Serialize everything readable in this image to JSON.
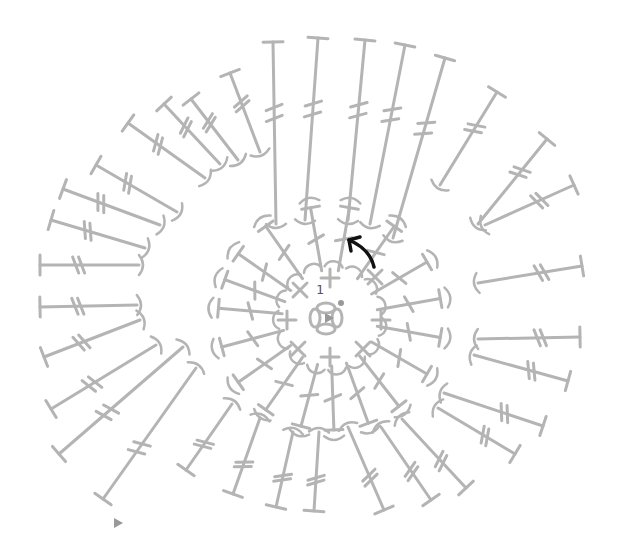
{
  "diagram": {
    "type": "crochet-chart",
    "title": "",
    "center": [
      330,
      318
    ],
    "colors": {
      "stitch": "#b4b4b4",
      "arrow": "#111111",
      "label": "#555555",
      "background": "#ffffff"
    },
    "round_label": "1",
    "round_label_pos": [
      316,
      294
    ],
    "magic_ring": {
      "cx": 326,
      "cy": 318,
      "r": 16,
      "start_dot": [
        341,
        303
      ]
    },
    "start_marker": {
      "icon": "triangle-marker",
      "pos": [
        329,
        318
      ]
    },
    "end_marker": {
      "icon": "triangle-marker",
      "pos": [
        118,
        523
      ]
    },
    "direction_arrow": {
      "icon": "curved-arrow",
      "from": [
        374,
        267
      ],
      "to": [
        349,
        240
      ]
    },
    "round1": {
      "stitch_type": "single-crochet",
      "stitches": [
        {
          "symbol": "+",
          "pos": [
            330,
            278
          ]
        },
        {
          "symbol": "x",
          "pos": [
            375,
            277
          ]
        },
        {
          "symbol": "+",
          "pos": [
            381,
            320
          ]
        },
        {
          "symbol": "x",
          "pos": [
            363,
            349
          ]
        },
        {
          "symbol": "+",
          "pos": [
            330,
            357
          ]
        },
        {
          "symbol": "x",
          "pos": [
            298,
            349
          ]
        },
        {
          "symbol": "+",
          "pos": [
            287,
            320
          ]
        },
        {
          "symbol": "x",
          "pos": [
            300,
            290
          ]
        }
      ]
    },
    "round2": {
      "stitch_type": "double-crochet",
      "inner_radius": 48,
      "outer_radius": 112,
      "angles_deg": [
        -100,
        -80,
        -55,
        -30,
        -10,
        10,
        30,
        52,
        70,
        88,
        105,
        125,
        145,
        165,
        185,
        200,
        215,
        235
      ]
    },
    "round3": {
      "stitch_type": "treble-crochet",
      "spokes": [
        {
          "from": [
            276,
            224
          ],
          "to": [
            273,
            42
          ]
        },
        {
          "from": [
            305,
            220
          ],
          "to": [
            318,
            38
          ]
        },
        {
          "from": [
            348,
            220
          ],
          "to": [
            365,
            40
          ]
        },
        {
          "from": [
            370,
            224
          ],
          "to": [
            405,
            45
          ]
        },
        {
          "from": [
            393,
            238
          ],
          "to": [
            445,
            58
          ]
        },
        {
          "from": [
            440,
            185
          ],
          "to": [
            497,
            92
          ]
        },
        {
          "from": [
            478,
            224
          ],
          "to": [
            547,
            139
          ]
        },
        {
          "from": [
            485,
            225
          ],
          "to": [
            574,
            185
          ]
        },
        {
          "from": [
            478,
            283
          ],
          "to": [
            582,
            266
          ]
        },
        {
          "from": [
            478,
            339
          ],
          "to": [
            580,
            337
          ]
        },
        {
          "from": [
            474,
            355
          ],
          "to": [
            568,
            381
          ]
        },
        {
          "from": [
            444,
            393
          ],
          "to": [
            543,
            426
          ]
        },
        {
          "from": [
            438,
            408
          ],
          "to": [
            515,
            454
          ]
        },
        {
          "from": [
            402,
            419
          ],
          "to": [
            466,
            488
          ]
        },
        {
          "from": [
            381,
            427
          ],
          "to": [
            431,
            500
          ]
        },
        {
          "from": [
            348,
            427
          ],
          "to": [
            384,
            510
          ]
        },
        {
          "from": [
            319,
            432
          ],
          "to": [
            314,
            511
          ]
        },
        {
          "from": [
            293,
            432
          ],
          "to": [
            276,
            507
          ]
        },
        {
          "from": [
            260,
            418
          ],
          "to": [
            233,
            494
          ]
        },
        {
          "from": [
            232,
            404
          ],
          "to": [
            186,
            470
          ]
        },
        {
          "from": [
            196,
            368
          ],
          "to": [
            103,
            499
          ]
        },
        {
          "from": [
            183,
            347
          ],
          "to": [
            59,
            454
          ]
        },
        {
          "from": [
            156,
            345
          ],
          "to": [
            51,
            409
          ]
        },
        {
          "from": [
            140,
            320
          ],
          "to": [
            44,
            357
          ]
        },
        {
          "from": [
            137,
            305
          ],
          "to": [
            40,
            307
          ]
        },
        {
          "from": [
            139,
            265
          ],
          "to": [
            40,
            265
          ]
        },
        {
          "from": [
            145,
            248
          ],
          "to": [
            51,
            220
          ]
        },
        {
          "from": [
            160,
            225
          ],
          "to": [
            63,
            189
          ]
        },
        {
          "from": [
            177,
            212
          ],
          "to": [
            96,
            165
          ]
        },
        {
          "from": [
            205,
            178
          ],
          "to": [
            128,
            123
          ]
        },
        {
          "from": [
            220,
            164
          ],
          "to": [
            164,
            104
          ]
        },
        {
          "from": [
            238,
            160
          ],
          "to": [
            191,
            99
          ]
        },
        {
          "from": [
            260,
            152
          ],
          "to": [
            230,
            73
          ]
        }
      ]
    }
  }
}
